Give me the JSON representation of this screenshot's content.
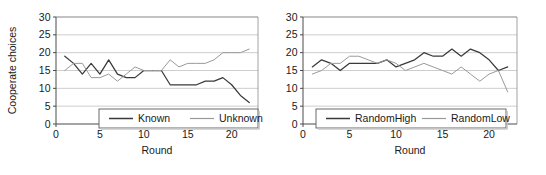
{
  "figure": {
    "background": "#ffffff",
    "panel_count": 2
  },
  "chart_data": [
    {
      "type": "line",
      "panel": "left",
      "title": "",
      "xlabel": "Round",
      "ylabel": "Cooperate choices",
      "xlim": [
        0,
        23
      ],
      "ylim": [
        0,
        30
      ],
      "xticks": [
        0,
        5,
        10,
        15,
        20
      ],
      "yticks": [
        0,
        5,
        10,
        15,
        20,
        25,
        30
      ],
      "grid": "horizontal",
      "legend_position": "bottom-right-inside",
      "x": [
        1,
        2,
        3,
        4,
        5,
        6,
        7,
        8,
        9,
        10,
        11,
        12,
        13,
        14,
        15,
        16,
        17,
        18,
        19,
        20,
        21,
        22
      ],
      "series": [
        {
          "name": "Known",
          "color": "#3a3a3a",
          "values": [
            19,
            17,
            14,
            17,
            14,
            18,
            14,
            13,
            13,
            15,
            15,
            15,
            11,
            11,
            11,
            11,
            12,
            12,
            13,
            11,
            8,
            6
          ]
        },
        {
          "name": "Unknown",
          "color": "#9a9a9a",
          "values": [
            15,
            17,
            17,
            13,
            13,
            14,
            12,
            14,
            16,
            15,
            15,
            15,
            18,
            16,
            17,
            17,
            17,
            18,
            20,
            20,
            20,
            21
          ]
        }
      ]
    },
    {
      "type": "line",
      "panel": "right",
      "title": "",
      "xlabel": "Round",
      "ylabel": "",
      "xlim": [
        0,
        23
      ],
      "ylim": [
        0,
        30
      ],
      "xticks": [
        0,
        5,
        10,
        15,
        20
      ],
      "yticks": [
        0,
        5,
        10,
        15,
        20,
        25,
        30
      ],
      "grid": "horizontal",
      "legend_position": "bottom-center-inside",
      "x": [
        1,
        2,
        3,
        4,
        5,
        6,
        7,
        8,
        9,
        10,
        11,
        12,
        13,
        14,
        15,
        16,
        17,
        18,
        19,
        20,
        21,
        22
      ],
      "series": [
        {
          "name": "RandomHigh",
          "color": "#3a3a3a",
          "values": [
            16,
            18,
            17,
            15,
            17,
            17,
            17,
            17,
            18,
            16,
            17,
            18,
            20,
            19,
            19,
            21,
            19,
            21,
            20,
            18,
            15,
            16
          ]
        },
        {
          "name": "RandomLow",
          "color": "#9a9a9a",
          "values": [
            14,
            15,
            17,
            17,
            19,
            19,
            18,
            17,
            18,
            17,
            15,
            16,
            17,
            16,
            15,
            14,
            16,
            14,
            12,
            14,
            15,
            9
          ]
        }
      ]
    }
  ],
  "left_panel": {
    "ylabel": "Cooperate choices",
    "xlabel": "Round",
    "ytick_labels": [
      "0",
      "5",
      "10",
      "15",
      "20",
      "25",
      "30"
    ],
    "xtick_labels": [
      "0",
      "5",
      "10",
      "15",
      "20"
    ],
    "legend": {
      "items": [
        {
          "label": "Known",
          "color": "#3a3a3a"
        },
        {
          "label": "Unknown",
          "color": "#9a9a9a"
        }
      ]
    }
  },
  "right_panel": {
    "ylabel": "",
    "xlabel": "Round",
    "ytick_labels": [
      "0",
      "5",
      "10",
      "15",
      "20",
      "25",
      "30"
    ],
    "xtick_labels": [
      "0",
      "5",
      "10",
      "15",
      "20"
    ],
    "legend": {
      "items": [
        {
          "label": "RandomHigh",
          "color": "#3a3a3a"
        },
        {
          "label": "RandomLow",
          "color": "#9a9a9a"
        }
      ]
    }
  }
}
